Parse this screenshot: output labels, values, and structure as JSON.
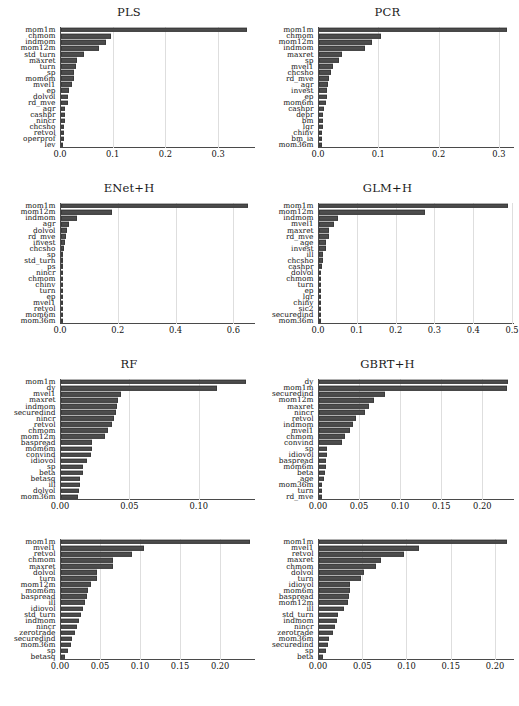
{
  "figure": {
    "width": 517,
    "height": 706,
    "bar_color": "#4d4d4d",
    "grid_color": "#dedede",
    "axis_color": "#4a4a4a"
  },
  "chart_data": [
    {
      "type": "bar",
      "orientation": "horizontal",
      "title": "PLS",
      "xlabel": "",
      "ylabel": "",
      "xlim": [
        0.0,
        0.37
      ],
      "grid": true,
      "ticks": [
        0.0,
        0.1,
        0.2,
        0.3
      ],
      "ticklabels": [
        "0.0",
        "0.1",
        "0.2",
        "0.3"
      ],
      "categories": [
        "mom1m",
        "chmom",
        "indmom",
        "mom12m",
        "std_turn",
        "maxret",
        "turn",
        "sp",
        "mom6m",
        "mvel1",
        "ep",
        "dolvol",
        "rd_mve",
        "agr",
        "cashpr",
        "nincr",
        "chcsho",
        "retvol",
        "operprof",
        "lev"
      ],
      "values": [
        0.352,
        0.0955,
        0.0855,
        0.0715,
        0.0435,
        0.0305,
        0.0285,
        0.0255,
        0.0245,
        0.0215,
        0.0145,
        0.0135,
        0.013,
        0.0085,
        0.008,
        0.007,
        0.0065,
        0.0058,
        0.0052,
        0.004
      ]
    },
    {
      "type": "bar",
      "orientation": "horizontal",
      "title": "PCR",
      "xlabel": "",
      "ylabel": "",
      "xlim": [
        0.0,
        0.325
      ],
      "grid": true,
      "ticks": [
        0.0,
        0.1,
        0.2,
        0.3
      ],
      "ticklabels": [
        "0.0",
        "0.1",
        "0.2",
        "0.3"
      ],
      "categories": [
        "mom1m",
        "chmom",
        "mom12m",
        "indmom",
        "maxret",
        "sp",
        "mvel1",
        "chcsho",
        "rd_mve",
        "agr",
        "invest",
        "ep",
        "mom6m",
        "cashpr",
        "depr",
        "bm",
        "lgr",
        "chinv",
        "bm_ia",
        "mom36m"
      ],
      "values": [
        0.311,
        0.1035,
        0.088,
        0.076,
        0.0385,
        0.0325,
        0.0235,
        0.02,
        0.016,
        0.0155,
        0.014,
        0.013,
        0.012,
        0.0085,
        0.007,
        0.0065,
        0.006,
        0.0055,
        0.005,
        0.0045
      ]
    },
    {
      "type": "bar",
      "orientation": "horizontal",
      "title": "ENet+H",
      "xlabel": "",
      "ylabel": "",
      "xlim": [
        0.0,
        0.675
      ],
      "grid": true,
      "ticks": [
        0.0,
        0.2,
        0.4,
        0.6
      ],
      "ticklabels": [
        "0.0",
        "0.2",
        "0.4",
        "0.6"
      ],
      "categories": [
        "mom1m",
        "mom12m",
        "indmom",
        "agr",
        "dolvol",
        "rd_mve",
        "invest",
        "chcsho",
        "sp",
        "std_turn",
        "ps",
        "nincr",
        "chmom",
        "chinv",
        "turn",
        "ep",
        "mvel1",
        "retvol",
        "mom6m",
        "mom36m"
      ],
      "values": [
        0.648,
        0.178,
        0.0545,
        0.0265,
        0.0195,
        0.0165,
        0.014,
        0.0115,
        0.006,
        0.0052,
        0.003,
        0.0016,
        0.001,
        0.0008,
        0.0006,
        0.0005,
        0.0004,
        0.0003,
        0.0002,
        0.0001
      ]
    },
    {
      "type": "bar",
      "orientation": "horizontal",
      "title": "GLM+H",
      "xlabel": "",
      "ylabel": "",
      "xlim": [
        0.0,
        0.505
      ],
      "grid": true,
      "ticks": [
        0.0,
        0.1,
        0.2,
        0.3,
        0.4,
        0.5
      ],
      "ticklabels": [
        "0.0",
        "0.1",
        "0.2",
        "0.3",
        "0.4",
        "0.5"
      ],
      "categories": [
        "mom1m",
        "mom12m",
        "indmom",
        "mvel1",
        "maxret",
        "rd_mve",
        "age",
        "invest",
        "ill",
        "chcsho",
        "cashpr",
        "dolvol",
        "chmom",
        "turn",
        "ep",
        "lgr",
        "chinv",
        "sic2",
        "securedind",
        "mom36m"
      ],
      "values": [
        0.486,
        0.272,
        0.048,
        0.0395,
        0.0265,
        0.025,
        0.0185,
        0.0175,
        0.0115,
        0.01,
        0.0075,
        0.0042,
        0.003,
        0.0022,
        0.0014,
        0.0012,
        0.001,
        0.0008,
        0.0006,
        0.0004
      ]
    },
    {
      "type": "bar",
      "orientation": "horizontal",
      "title": "RF",
      "xlabel": "",
      "ylabel": "",
      "xlim": [
        0.0,
        0.1405
      ],
      "grid": true,
      "ticks": [
        0.0,
        0.05,
        0.1
      ],
      "ticklabels": [
        "0.00",
        "0.05",
        "0.10"
      ],
      "categories": [
        "mom1m",
        "dy",
        "mvel1",
        "maxret",
        "indmom",
        "securedind",
        "nincr",
        "retvol",
        "chmom",
        "mom12m",
        "baspread",
        "mom6m",
        "convind",
        "idiovol",
        "sp",
        "beta",
        "betasq",
        "ill",
        "dolvol",
        "mom36m"
      ],
      "values": [
        0.1335,
        0.1125,
        0.0435,
        0.0412,
        0.0405,
        0.0395,
        0.0385,
        0.0365,
        0.034,
        0.0315,
        0.0225,
        0.022,
        0.0215,
        0.019,
        0.0162,
        0.0155,
        0.014,
        0.0135,
        0.013,
        0.0122
      ]
    },
    {
      "type": "bar",
      "orientation": "horizontal",
      "title": "GBRT+H",
      "xlabel": "",
      "ylabel": "",
      "xlim": [
        0.0,
        0.2385
      ],
      "grid": true,
      "ticks": [
        0.0,
        0.05,
        0.1,
        0.15,
        0.2
      ],
      "ticklabels": [
        "0.00",
        "0.05",
        "0.10",
        "0.15",
        "0.20"
      ],
      "categories": [
        "dy",
        "mom1m",
        "securedind",
        "mom12m",
        "maxret",
        "nincr",
        "retvol",
        "indmom",
        "mvel1",
        "chmom",
        "convind",
        "sp",
        "idiovol",
        "baspread",
        "mom6m",
        "beta",
        "age",
        "mom36m",
        "turn",
        "rd_mve"
      ],
      "values": [
        0.23,
        0.2285,
        0.08,
        0.0675,
        0.0605,
        0.0555,
        0.0445,
        0.041,
        0.038,
        0.0315,
        0.028,
        0.0095,
        0.0092,
        0.009,
        0.0085,
        0.0078,
        0.0062,
        0.004,
        0.0035,
        0.0032
      ]
    },
    {
      "type": "bar",
      "orientation": "horizontal",
      "title": "",
      "xlabel": "",
      "ylabel": "",
      "xlim": [
        0.0,
        0.2435
      ],
      "grid": true,
      "ticks": [
        0.0,
        0.05,
        0.1,
        0.15,
        0.2
      ],
      "ticklabels": [
        "0.00",
        "0.05",
        "0.10",
        "0.15",
        "0.20"
      ],
      "categories": [
        "mom1m",
        "mvel1",
        "retvol",
        "chmom",
        "maxret",
        "dolvol",
        "turn",
        "mom12m",
        "mom6m",
        "baspread",
        "ill",
        "idiovol",
        "std_turn",
        "indmom",
        "nincr",
        "zerotrade",
        "securedind",
        "mom36m",
        "sp",
        "betasq"
      ],
      "values": [
        0.2355,
        0.1035,
        0.089,
        0.0655,
        0.065,
        0.0455,
        0.0445,
        0.0375,
        0.034,
        0.032,
        0.0305,
        0.028,
        0.0245,
        0.0225,
        0.0195,
        0.0175,
        0.014,
        0.012,
        0.0085,
        0.0045
      ]
    },
    {
      "type": "bar",
      "orientation": "horizontal",
      "title": "",
      "xlabel": "",
      "ylabel": "",
      "xlim": [
        0.0,
        0.2215
      ],
      "grid": true,
      "ticks": [
        0.0,
        0.05,
        0.1,
        0.15,
        0.2
      ],
      "ticklabels": [
        "0.00",
        "0.05",
        "0.10",
        "0.15",
        "0.20"
      ],
      "categories": [
        "mom1m",
        "mvel1",
        "retvol",
        "maxret",
        "chmom",
        "dolvol",
        "turn",
        "idiovol",
        "mom6m",
        "baspread",
        "mom12m",
        "ill",
        "std_turn",
        "indmom",
        "nincr",
        "zerotrade",
        "mom36m",
        "securedind",
        "sp",
        "beta"
      ],
      "values": [
        0.2125,
        0.113,
        0.0955,
        0.07,
        0.064,
        0.051,
        0.048,
        0.0355,
        0.0345,
        0.0335,
        0.0325,
        0.028,
        0.0215,
        0.02,
        0.0185,
        0.016,
        0.0112,
        0.0105,
        0.0075,
        0.0045
      ]
    }
  ]
}
